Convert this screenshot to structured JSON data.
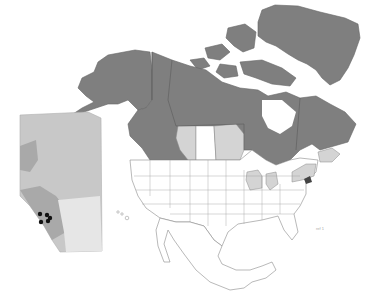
{
  "map": {
    "title": "",
    "colors": {
      "background": "#ffffff",
      "occupied_dark": "#7f7f7f",
      "occupied_light": "#d4d4d4",
      "unshaded": "#ffffff",
      "border": "#8a8a8a",
      "inset_base": "#c8c8c8",
      "inset_mid": "#a9a9a9",
      "inset_light": "#e6e6e6",
      "inset_points": "#111111"
    },
    "regions": [
      {
        "name": "Greenland",
        "shade": "dark"
      },
      {
        "name": "Alaska",
        "shade": "dark"
      },
      {
        "name": "Yukon",
        "shade": "dark"
      },
      {
        "name": "Northwest Territories",
        "shade": "dark"
      },
      {
        "name": "Nunavut",
        "shade": "dark"
      },
      {
        "name": "British Columbia",
        "shade": "dark"
      },
      {
        "name": "Alberta",
        "shade": "light"
      },
      {
        "name": "Saskatchewan",
        "shade": "none"
      },
      {
        "name": "Manitoba",
        "shade": "light"
      },
      {
        "name": "Ontario",
        "shade": "dark"
      },
      {
        "name": "Quebec",
        "shade": "dark"
      },
      {
        "name": "Newfoundland and Labrador",
        "shade": "dark"
      },
      {
        "name": "Maritimes",
        "shade": "light"
      },
      {
        "name": "Wisconsin",
        "shade": "light"
      },
      {
        "name": "Michigan",
        "shade": "light"
      },
      {
        "name": "New York",
        "shade": "light"
      },
      {
        "name": "New England",
        "shade": "light"
      },
      {
        "name": "Contiguous United States (other)",
        "shade": "none"
      },
      {
        "name": "Mexico",
        "shade": "none"
      }
    ],
    "inset": {
      "name": "Alberta inset",
      "points": [
        {
          "x": 40,
          "y": 214
        },
        {
          "x": 47,
          "y": 215
        },
        {
          "x": 50,
          "y": 218
        },
        {
          "x": 41,
          "y": 222
        },
        {
          "x": 48,
          "y": 221
        }
      ]
    },
    "scale_label": "ref 1"
  }
}
